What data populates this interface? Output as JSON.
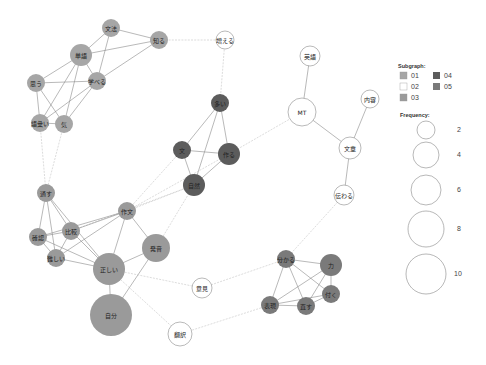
{
  "legend": {
    "subgraph_title": "Subgraph:",
    "subgraphs": [
      {
        "id": "01",
        "label": "01",
        "color": "#a6a6a6"
      },
      {
        "id": "02",
        "label": "02",
        "color": "#ffffff"
      },
      {
        "id": "03",
        "label": "03",
        "color": "#9a9a9a"
      },
      {
        "id": "04",
        "label": "04",
        "color": "#5c5c5c"
      },
      {
        "id": "05",
        "label": "05",
        "color": "#7a7a7a"
      }
    ],
    "frequency_title": "Frequency:",
    "frequencies": [
      {
        "label": "2",
        "r": 9
      },
      {
        "label": "4",
        "r": 12
      },
      {
        "label": "6",
        "r": 15
      },
      {
        "label": "8",
        "r": 18
      },
      {
        "label": "10",
        "r": 20
      }
    ]
  },
  "nodes": [
    {
      "id": "bunpo",
      "label": "文法",
      "x": 111,
      "y": 28,
      "r": 9,
      "group": "01"
    },
    {
      "id": "shiru",
      "label": "知る",
      "x": 159,
      "y": 40,
      "r": 9,
      "group": "01"
    },
    {
      "id": "tango",
      "label": "単語",
      "x": 81,
      "y": 55,
      "r": 11,
      "group": "01"
    },
    {
      "id": "manaberu",
      "label": "学べる",
      "x": 97,
      "y": 81,
      "r": 9,
      "group": "01"
    },
    {
      "id": "omou",
      "label": "思う",
      "x": 36,
      "y": 83,
      "r": 9,
      "group": "01"
    },
    {
      "id": "goi",
      "label": "語彙い",
      "x": 40,
      "y": 123,
      "r": 9,
      "group": "01"
    },
    {
      "id": "ki",
      "label": "気",
      "x": 64,
      "y": 124,
      "r": 9,
      "group": "01"
    },
    {
      "id": "fueru",
      "label": "増える",
      "x": 225,
      "y": 40,
      "r": 9,
      "group": "02"
    },
    {
      "id": "eigo",
      "label": "英語",
      "x": 310,
      "y": 56,
      "r": 10,
      "group": "02"
    },
    {
      "id": "mt",
      "label": "MT",
      "x": 302,
      "y": 112,
      "r": 14,
      "group": "02"
    },
    {
      "id": "naiyo",
      "label": "内容",
      "x": 370,
      "y": 99,
      "r": 9,
      "group": "02"
    },
    {
      "id": "bunsho",
      "label": "文章",
      "x": 350,
      "y": 148,
      "r": 11,
      "group": "02"
    },
    {
      "id": "tsutawaru",
      "label": "伝わる",
      "x": 344,
      "y": 195,
      "r": 10,
      "group": "02"
    },
    {
      "id": "iken",
      "label": "意見",
      "x": 202,
      "y": 288,
      "r": 10,
      "group": "02"
    },
    {
      "id": "honyaku",
      "label": "翻訳",
      "x": 180,
      "y": 334,
      "r": 12,
      "group": "02"
    },
    {
      "id": "oi",
      "label": "多い",
      "x": 220,
      "y": 103,
      "r": 9,
      "group": "04"
    },
    {
      "id": "bun",
      "label": "文",
      "x": 182,
      "y": 150,
      "r": 9,
      "group": "04"
    },
    {
      "id": "tsukuru",
      "label": "作る",
      "x": 229,
      "y": 154,
      "r": 11,
      "group": "04"
    },
    {
      "id": "shizen",
      "label": "自然",
      "x": 194,
      "y": 185,
      "r": 11,
      "group": "04"
    },
    {
      "id": "toosu",
      "label": "通す",
      "x": 46,
      "y": 193,
      "r": 9,
      "group": "03"
    },
    {
      "id": "sakubun",
      "label": "作文",
      "x": 127,
      "y": 211,
      "r": 9,
      "group": "03"
    },
    {
      "id": "kakunin",
      "label": "確認",
      "x": 38,
      "y": 237,
      "r": 9,
      "group": "03"
    },
    {
      "id": "hikaku",
      "label": "比較",
      "x": 71,
      "y": 231,
      "r": 9,
      "group": "03"
    },
    {
      "id": "muzukashii",
      "label": "難しい",
      "x": 56,
      "y": 258,
      "r": 9,
      "group": "03"
    },
    {
      "id": "hatsuon",
      "label": "発音",
      "x": 156,
      "y": 248,
      "r": 14,
      "group": "03"
    },
    {
      "id": "tadashii",
      "label": "正しい",
      "x": 109,
      "y": 269,
      "r": 16,
      "group": "03"
    },
    {
      "id": "jibun",
      "label": "自分",
      "x": 111,
      "y": 315,
      "r": 21,
      "group": "03"
    },
    {
      "id": "wakaru",
      "label": "分かる",
      "x": 286,
      "y": 259,
      "r": 9,
      "group": "05"
    },
    {
      "id": "chikara",
      "label": "力",
      "x": 331,
      "y": 265,
      "r": 11,
      "group": "05"
    },
    {
      "id": "tsuku",
      "label": "付く",
      "x": 331,
      "y": 294,
      "r": 9,
      "group": "05"
    },
    {
      "id": "hyogen",
      "label": "表現",
      "x": 270,
      "y": 305,
      "r": 9,
      "group": "05"
    },
    {
      "id": "naosu",
      "label": "直す",
      "x": 306,
      "y": 306,
      "r": 9,
      "group": "05"
    }
  ],
  "edges": [
    [
      "bunpo",
      "shiru",
      0
    ],
    [
      "bunpo",
      "tango",
      0
    ],
    [
      "bunpo",
      "manaberu",
      0
    ],
    [
      "shiru",
      "tango",
      0
    ],
    [
      "shiru",
      "manaberu",
      0
    ],
    [
      "shiru",
      "fueru",
      1
    ],
    [
      "tango",
      "manaberu",
      0
    ],
    [
      "tango",
      "omou",
      0
    ],
    [
      "tango",
      "goi",
      0
    ],
    [
      "tango",
      "ki",
      0
    ],
    [
      "manaberu",
      "omou",
      0
    ],
    [
      "manaberu",
      "goi",
      0
    ],
    [
      "manaberu",
      "ki",
      0
    ],
    [
      "omou",
      "goi",
      0
    ],
    [
      "omou",
      "ki",
      0
    ],
    [
      "goi",
      "ki",
      0
    ],
    [
      "goi",
      "toosu",
      1
    ],
    [
      "ki",
      "toosu",
      1
    ],
    [
      "fueru",
      "oi",
      1
    ],
    [
      "oi",
      "bun",
      0
    ],
    [
      "oi",
      "tsukuru",
      0
    ],
    [
      "oi",
      "shizen",
      0
    ],
    [
      "bun",
      "tsukuru",
      0
    ],
    [
      "bun",
      "shizen",
      0
    ],
    [
      "tsukuru",
      "shizen",
      0
    ],
    [
      "tsukuru",
      "mt",
      1
    ],
    [
      "eigo",
      "mt",
      0
    ],
    [
      "mt",
      "bunsho",
      0
    ],
    [
      "naiyo",
      "bunsho",
      0
    ],
    [
      "bunsho",
      "tsutawaru",
      0
    ],
    [
      "tsutawaru",
      "wakaru",
      1
    ],
    [
      "sakubun",
      "bun",
      1
    ],
    [
      "sakubun",
      "shizen",
      1
    ],
    [
      "sakubun",
      "tsukuru",
      1
    ],
    [
      "hikaku",
      "shizen",
      1
    ],
    [
      "shizen",
      "hatsuon",
      1
    ],
    [
      "toosu",
      "kakunin",
      0
    ],
    [
      "toosu",
      "hikaku",
      0
    ],
    [
      "toosu",
      "muzukashii",
      0
    ],
    [
      "toosu",
      "tadashii",
      0
    ],
    [
      "kakunin",
      "hikaku",
      0
    ],
    [
      "kakunin",
      "muzukashii",
      0
    ],
    [
      "kakunin",
      "tadashii",
      0
    ],
    [
      "kakunin",
      "sakubun",
      0
    ],
    [
      "hikaku",
      "muzukashii",
      0
    ],
    [
      "hikaku",
      "sakubun",
      0
    ],
    [
      "hikaku",
      "tadashii",
      0
    ],
    [
      "muzukashii",
      "tadashii",
      0
    ],
    [
      "muzukashii",
      "sakubun",
      0
    ],
    [
      "sakubun",
      "tadashii",
      0
    ],
    [
      "sakubun",
      "hatsuon",
      0
    ],
    [
      "hatsuon",
      "tadashii",
      0
    ],
    [
      "hatsuon",
      "jibun",
      0
    ],
    [
      "tadashii",
      "jibun",
      0
    ],
    [
      "tadashii",
      "iken",
      1
    ],
    [
      "tadashii",
      "honyaku",
      1
    ],
    [
      "iken",
      "wakaru",
      1
    ],
    [
      "honyaku",
      "hyogen",
      1
    ],
    [
      "wakaru",
      "chikara",
      0
    ],
    [
      "wakaru",
      "tsuku",
      0
    ],
    [
      "wakaru",
      "hyogen",
      0
    ],
    [
      "wakaru",
      "naosu",
      0
    ],
    [
      "chikara",
      "tsuku",
      0
    ],
    [
      "chikara",
      "hyogen",
      0
    ],
    [
      "chikara",
      "naosu",
      0
    ],
    [
      "tsuku",
      "hyogen",
      0
    ],
    [
      "tsuku",
      "naosu",
      0
    ],
    [
      "hyogen",
      "naosu",
      0
    ]
  ]
}
